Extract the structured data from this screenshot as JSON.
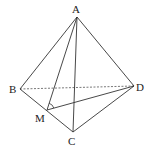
{
  "diagram": {
    "type": "tetrahedron",
    "points": {
      "A": {
        "label": "A",
        "x": 77,
        "y": 17
      },
      "B": {
        "label": "B",
        "x": 20,
        "y": 89
      },
      "C": {
        "label": "C",
        "x": 73,
        "y": 132
      },
      "D": {
        "label": "D",
        "x": 134,
        "y": 86
      },
      "M": {
        "label": "M",
        "x": 47,
        "y": 110
      }
    },
    "solid_edges": [
      "AB",
      "AC",
      "AD",
      "BC",
      "CD",
      "AM",
      "MD"
    ],
    "dashed_edges": [
      "BD"
    ],
    "angle_mark": {
      "vertex": "M",
      "between": [
        "A",
        "D"
      ]
    }
  }
}
